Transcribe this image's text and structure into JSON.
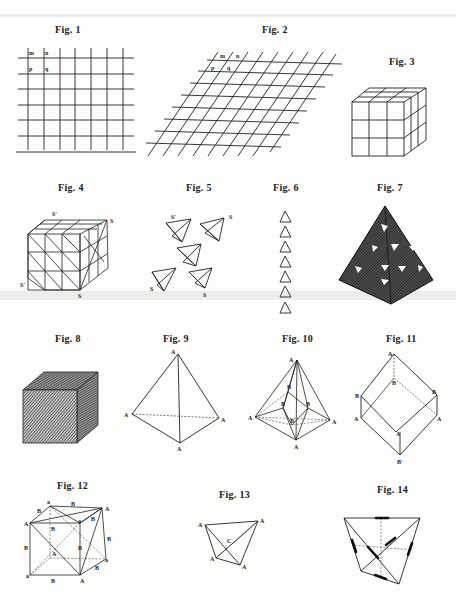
{
  "plate": {
    "header_text": "",
    "figures": [
      {
        "id": 1,
        "caption": "Fig. 1",
        "subject": "square lattice grid",
        "labels": [
          "m",
          "n",
          "p",
          "q"
        ]
      },
      {
        "id": 2,
        "caption": "Fig. 2",
        "subject": "oblique lattice grid",
        "labels": [
          "m",
          "n",
          "p",
          "q"
        ]
      },
      {
        "id": 3,
        "caption": "Fig. 3",
        "subject": "cube subdivided 3x3x3"
      },
      {
        "id": 4,
        "caption": "Fig. 4",
        "subject": "cube built of tetrahedral units",
        "labels": [
          "S'",
          "S",
          "S'",
          "S"
        ]
      },
      {
        "id": 5,
        "caption": "Fig. 5",
        "subject": "separate tetrahedral units",
        "labels": [
          "S'",
          "S",
          "S",
          "S"
        ]
      },
      {
        "id": 6,
        "caption": "Fig. 6",
        "subject": "column of seven triangles",
        "count": 7
      },
      {
        "id": 7,
        "caption": "Fig. 7",
        "subject": "shaded tetrahedron of stacked units"
      },
      {
        "id": 8,
        "caption": "Fig. 8",
        "subject": "hatched solid cube"
      },
      {
        "id": 9,
        "caption": "Fig. 9",
        "subject": "tetrahedron",
        "labels": [
          "A",
          "A",
          "A",
          "A"
        ]
      },
      {
        "id": 10,
        "caption": "Fig. 10",
        "subject": "tetrahedron with inner points",
        "labels": [
          "A",
          "A",
          "A",
          "A",
          "B",
          "B",
          "B",
          "B"
        ]
      },
      {
        "id": 11,
        "caption": "Fig. 11",
        "subject": "rhombohedron",
        "labels": [
          "A",
          "B",
          "B",
          "B",
          "A",
          "A",
          "A",
          "B'"
        ]
      },
      {
        "id": 12,
        "caption": "Fig. 12",
        "subject": "cube with inscribed tetrahedron",
        "labels": [
          "a",
          "B",
          "A",
          "B",
          "A",
          "B",
          "a",
          "B",
          "B",
          "A",
          "B",
          "a",
          "B",
          "a",
          "B",
          "A",
          "B"
        ]
      },
      {
        "id": 13,
        "caption": "Fig. 13",
        "subject": "tetrahedron with centre",
        "labels": [
          "A",
          "A",
          "C",
          "A",
          "A"
        ]
      },
      {
        "id": 14,
        "caption": "Fig. 14",
        "subject": "tetrahedron with marked edges"
      }
    ]
  }
}
